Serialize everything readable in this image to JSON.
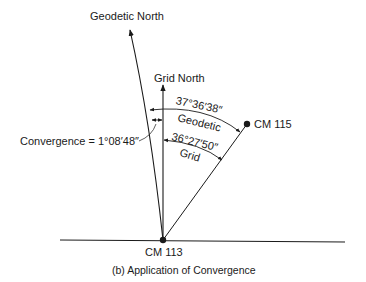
{
  "diagram": {
    "caption": "(b)  Application of Convergence",
    "labels": {
      "geodetic_north": "Geodetic North",
      "grid_north": "Grid North",
      "convergence": "Convergence = 1°08′48″",
      "cm115": "CM 115",
      "cm113": "CM 113",
      "geodetic_angle": "37°36′38″",
      "geodetic_word": "Geodetic",
      "grid_angle": "36°27′50″",
      "grid_word": "Grid"
    },
    "points": {
      "cm113": {
        "x": 163,
        "y": 240
      },
      "cm115": {
        "x": 247,
        "y": 124
      },
      "geodetic_north_tip": {
        "x": 129,
        "y": 29
      },
      "grid_north_tip": {
        "x": 163,
        "y": 84
      }
    },
    "colors": {
      "ink": "#1a1a1a",
      "background": "#ffffff"
    }
  }
}
